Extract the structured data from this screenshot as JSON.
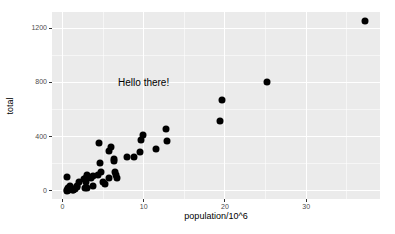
{
  "chart_data": {
    "type": "scatter",
    "title": "",
    "xlabel": "population/10^6",
    "ylabel": "total",
    "xlim": [
      -1.275,
      39.08
    ],
    "ylim": [
      -60.75,
      1319.75
    ],
    "x_major_ticks": [
      0,
      10,
      20,
      30
    ],
    "x_minor_gridlines": [
      5,
      15,
      25,
      35
    ],
    "y_major_ticks": [
      0,
      400,
      800,
      1200
    ],
    "y_minor_gridlines": [
      200,
      600,
      1000
    ],
    "grid": "major-and-minor",
    "legend": "none",
    "annotation": {
      "label": "Hello there!",
      "x": 10,
      "y": 800
    },
    "points": [
      [
        4.78,
        135
      ],
      [
        0.71,
        19
      ],
      [
        6.39,
        232
      ],
      [
        2.92,
        93
      ],
      [
        37.25,
        1257
      ],
      [
        5.03,
        65
      ],
      [
        3.57,
        97
      ],
      [
        0.9,
        38
      ],
      [
        0.6,
        99
      ],
      [
        19.69,
        669
      ],
      [
        9.69,
        376
      ],
      [
        1.36,
        7
      ],
      [
        1.57,
        12
      ],
      [
        12.83,
        364
      ],
      [
        6.48,
        142
      ],
      [
        3.05,
        21
      ],
      [
        2.85,
        63
      ],
      [
        4.34,
        116
      ],
      [
        4.53,
        351
      ],
      [
        1.33,
        11
      ],
      [
        5.77,
        293
      ],
      [
        6.55,
        118
      ],
      [
        9.88,
        413
      ],
      [
        5.3,
        53
      ],
      [
        2.97,
        120
      ],
      [
        5.99,
        321
      ],
      [
        0.99,
        12
      ],
      [
        1.83,
        32
      ],
      [
        2.7,
        84
      ],
      [
        1.32,
        5
      ],
      [
        8.79,
        246
      ],
      [
        2.06,
        67
      ],
      [
        19.38,
        517
      ],
      [
        9.54,
        286
      ],
      [
        0.67,
        4
      ],
      [
        11.54,
        310
      ],
      [
        3.75,
        111
      ],
      [
        3.83,
        36
      ],
      [
        12.7,
        457
      ],
      [
        1.05,
        16
      ],
      [
        4.63,
        207
      ],
      [
        0.81,
        8
      ],
      [
        6.35,
        219
      ],
      [
        25.15,
        805
      ],
      [
        2.76,
        22
      ],
      [
        0.63,
        2
      ],
      [
        8.0,
        250
      ],
      [
        6.72,
        93
      ],
      [
        1.85,
        27
      ],
      [
        5.69,
        97
      ],
      [
        0.56,
        5
      ]
    ],
    "colors": {
      "panel_background": "#EBEBEB",
      "gridline": "#FFFFFF",
      "point": "#000000",
      "tick_label": "#4D4D4D",
      "axis_title": "#000000",
      "tick_mark": "#333333",
      "plot_background": "#FFFFFF"
    }
  }
}
